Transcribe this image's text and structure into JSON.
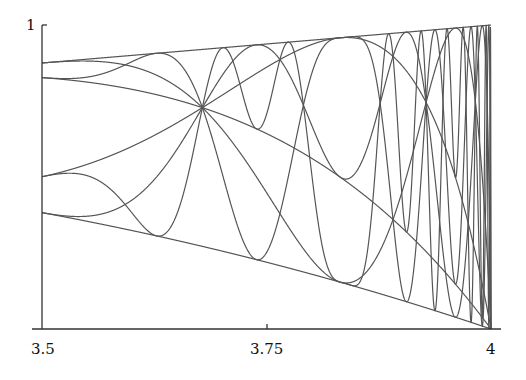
{
  "chart_data": {
    "type": "line",
    "title": "",
    "xlabel": "",
    "ylabel": "",
    "x_range": [
      3.5,
      4
    ],
    "ylim": [
      0,
      1
    ],
    "x_ticks": [
      3.5,
      3.75,
      4
    ],
    "x_tick_labels": [
      "3.5",
      "3.75",
      "4"
    ],
    "y_ticks": [
      1
    ],
    "y_tick_labels": [
      "1"
    ],
    "grid": false,
    "legend": null,
    "series": [
      {
        "name": "f^1(1/2)",
        "n": 1
      },
      {
        "name": "f^2(1/2)",
        "n": 2
      },
      {
        "name": "f^3(1/2)",
        "n": 3
      },
      {
        "name": "f^4(1/2)",
        "n": 4
      },
      {
        "name": "f^5(1/2)",
        "n": 5
      },
      {
        "name": "f^6(1/2)",
        "n": 6
      },
      {
        "name": "f^7(1/2)",
        "n": 7
      },
      {
        "name": "f^8(1/2)",
        "n": 8
      }
    ],
    "sample_values": {
      "r": [
        3.5,
        3.75,
        4
      ],
      "f1": [
        0.875,
        0.9375,
        1.0
      ],
      "f2": [
        0.383,
        0.22,
        0.0
      ]
    },
    "line_color": "#555555"
  }
}
